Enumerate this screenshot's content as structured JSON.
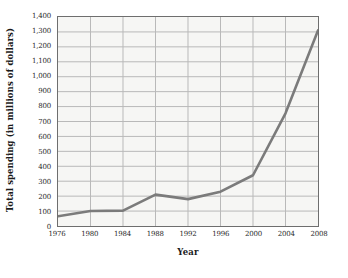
{
  "chart_data": {
    "type": "line",
    "title": "",
    "xlabel": "Year",
    "ylabel": "Total spending (in millions of dollars)",
    "x": [
      1976,
      1980,
      1984,
      1988,
      1992,
      1996,
      2000,
      2004,
      2008
    ],
    "values": [
      65,
      100,
      103,
      210,
      180,
      230,
      340,
      755,
      1310
    ],
    "series": [
      {
        "name": "Total spending",
        "values": [
          65,
          100,
          103,
          210,
          180,
          230,
          340,
          755,
          1310
        ]
      }
    ],
    "xlim": [
      1976,
      2008
    ],
    "ylim": [
      0,
      1400
    ],
    "xtick_labels": [
      "1976",
      "1980",
      "1984",
      "1988",
      "1992",
      "1996",
      "2000",
      "2004",
      "2008"
    ],
    "ytick_values": [
      0,
      100,
      200,
      300,
      400,
      500,
      600,
      700,
      800,
      900,
      1000,
      1100,
      1200,
      1300,
      1400
    ],
    "ytick_labels": [
      "0",
      "100",
      "200",
      "300",
      "400",
      "500",
      "600",
      "700",
      "800",
      "900",
      "1,000",
      "1,100",
      "1,200",
      "1,300",
      "1,400"
    ],
    "grid": true,
    "legend": "none",
    "line_color": "#7b7b7b",
    "grid_color": "#b9b9b9",
    "plot_background": "#f6f6f4",
    "border_color": "#6e6e6e"
  }
}
